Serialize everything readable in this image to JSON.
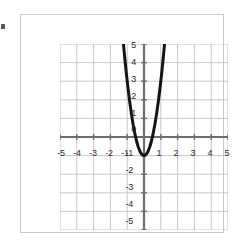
{
  "figure": {
    "kind": "coordinate-grid-parabola",
    "background_color": "#ffffff",
    "frame_color": "#c9c9c9",
    "grid_color": "#b9b9c4",
    "axis_color": "#6e6e6e",
    "curve_color": "#141414",
    "label_color": "#2b2b2b"
  },
  "axes": {
    "x_tick_labels": [
      "-5",
      "-4",
      "-3",
      "-2",
      "-1",
      "1",
      "2",
      "3",
      "4",
      "5"
    ],
    "y_tick_labels": [
      "5",
      "4",
      "3",
      "2",
      "1",
      "0",
      "-1",
      "-2",
      "-3",
      "-4",
      "-5"
    ]
  },
  "chart_data": {
    "type": "line",
    "title": "",
    "xlabel": "",
    "ylabel": "",
    "xlim": [
      -5,
      5
    ],
    "ylim": [
      -5,
      5
    ],
    "xticks": [
      -5,
      -4,
      -3,
      -2,
      -1,
      0,
      1,
      2,
      3,
      4,
      5
    ],
    "yticks": [
      -5,
      -4,
      -3,
      -2,
      -1,
      0,
      1,
      2,
      3,
      4,
      5
    ],
    "grid": true,
    "legend": "none",
    "series": [
      {
        "name": "parabola",
        "equation": "y = 4x^2 - 1",
        "vertex": [
          0,
          -1
        ],
        "roots": [
          -0.5,
          0.5
        ],
        "opens": "up",
        "color": "#141414",
        "line_width": 3,
        "x": [
          -1.25,
          -1.15,
          -1.05,
          -0.95,
          -0.85,
          -0.75,
          -0.65,
          -0.55,
          -0.45,
          -0.35,
          -0.25,
          -0.15,
          -0.05,
          0.05,
          0.15,
          0.25,
          0.35,
          0.45,
          0.55,
          0.65,
          0.75,
          0.85,
          0.95,
          1.05,
          1.15,
          1.25
        ],
        "y": [
          5.25,
          4.29,
          3.41,
          2.61,
          1.89,
          1.25,
          0.69,
          0.21,
          -0.19,
          -0.51,
          -0.75,
          -0.91,
          -0.99,
          -0.99,
          -0.91,
          -0.75,
          -0.51,
          -0.19,
          0.21,
          0.69,
          1.25,
          1.89,
          2.61,
          3.41,
          4.29,
          5.25
        ]
      }
    ]
  }
}
